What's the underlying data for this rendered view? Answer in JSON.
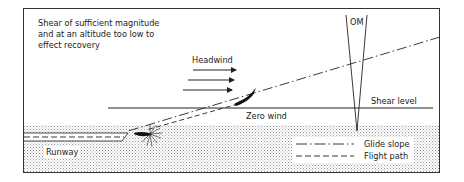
{
  "diagram": {
    "caption_lines": [
      "Shear of sufficient magnitude",
      "and at an altitude too low to",
      "effect recovery"
    ],
    "labels": {
      "om": "OM",
      "headwind": "Headwind",
      "shear_level": "Shear level",
      "zero_wind": "Zero wind",
      "runway": "Runway"
    },
    "legend": [
      {
        "style": "dash-dot",
        "label": "Glide slope"
      },
      {
        "style": "dashed",
        "label": "Flight path"
      }
    ],
    "colors": {
      "ink": "#222222",
      "ground_stipple": "#c8c8c8",
      "background": "#ffffff"
    }
  }
}
